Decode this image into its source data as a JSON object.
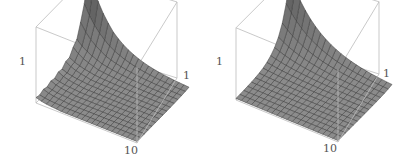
{
  "chart_data": [
    {
      "type": "surface3d",
      "title": "",
      "description": "3D surface plot with sharp peak near the back-left corner, decaying quickly to a flat floor; bumpy ridge along left edge",
      "axis_labels": {
        "z_max": "1",
        "y_max": "1",
        "x_max": "10"
      },
      "grid": {
        "nx": 20,
        "ny": 14
      },
      "box": {
        "floor": [
          [
            36,
            103
          ],
          [
            137,
            143
          ],
          [
            177,
            78
          ],
          [
            88,
            50
          ]
        ],
        "height": 40
      },
      "surface_kind": "noisy_peak",
      "peak_value": 1.0,
      "fill": "#8a8a8a",
      "mesh": "#3a3a3a",
      "box_color": "#bbbbbb"
    },
    {
      "type": "surface3d",
      "title": "",
      "description": "3D surface plot with smooth exponential decay from a peak at the back-left corner down to a flat floor",
      "axis_labels": {
        "z_max": "1",
        "y_max": "1",
        "x_max": "10"
      },
      "grid": {
        "nx": 20,
        "ny": 14
      },
      "box": {
        "floor": [
          [
            31,
            100
          ],
          [
            133,
            142
          ],
          [
            174,
            74
          ],
          [
            85,
            46
          ]
        ],
        "height": 38
      },
      "surface_kind": "smooth_peak",
      "peak_value": 1.0,
      "fill": "#8a8a8a",
      "mesh": "#3a3a3a",
      "box_color": "#bbbbbb"
    }
  ],
  "plots": [
    {
      "labels": {
        "z": "1",
        "y": "1",
        "x": "10"
      }
    },
    {
      "labels": {
        "z": "1",
        "y": "1",
        "x": "10"
      }
    }
  ]
}
